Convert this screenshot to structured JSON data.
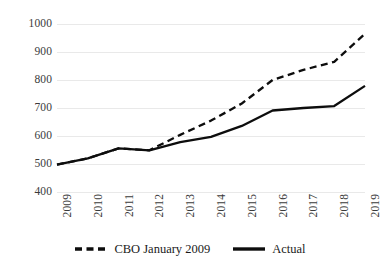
{
  "chart_data": {
    "type": "line",
    "title": "",
    "subtitle": "",
    "xlabel": "",
    "ylabel": "",
    "categories": [
      "2009",
      "2010",
      "2011",
      "2012",
      "2013",
      "2014",
      "2015",
      "2016",
      "2017",
      "2018",
      "2019"
    ],
    "x_tick_labels": [
      "2009",
      "2010",
      "2011",
      "2012",
      "2013",
      "2014",
      "2015",
      "2016",
      "2017",
      "2018",
      "2019"
    ],
    "y_tick_labels": [
      "1000",
      "900",
      "800",
      "700",
      "600",
      "500",
      "400"
    ],
    "y_ticks": [
      400,
      500,
      600,
      700,
      800,
      900,
      1000
    ],
    "ylim": [
      400,
      1000
    ],
    "xlim": [
      "2009",
      "2019"
    ],
    "grid": "horizontal",
    "legend_position": "bottom-center",
    "series": [
      {
        "name": "CBO January 2009",
        "style": "dashed",
        "color": "#0d0d0d",
        "values": [
          498,
          520,
          556,
          549,
          604,
          655,
          716,
          800,
          836,
          865,
          965
        ]
      },
      {
        "name": "Actual",
        "style": "solid",
        "color": "#0d0d0d",
        "values": [
          498,
          520,
          556,
          549,
          578,
          597,
          636,
          691,
          700,
          707,
          779
        ]
      }
    ]
  },
  "legend": {
    "entries": [
      {
        "label": "CBO January 2009",
        "style": "dashed"
      },
      {
        "label": "Actual",
        "style": "solid"
      }
    ]
  },
  "colors": {
    "line": "#0d0d0d",
    "gridline": "#e9e9e9",
    "tick_text": "#3b3b3b",
    "background": "#ffffff"
  }
}
